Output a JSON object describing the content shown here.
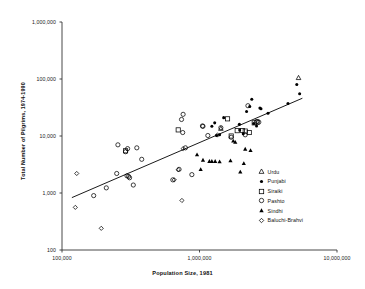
{
  "chart_data": {
    "type": "scatter",
    "title": "",
    "xlabel": "Population Size, 1981",
    "ylabel": "Total Number of Pilgrims, 1974-1990",
    "xscale": "log",
    "yscale": "log",
    "xlim": [
      100000,
      10000000
    ],
    "ylim": [
      100,
      1000000
    ],
    "grid": false,
    "legend_position": "inside-lower-right",
    "xticks": [
      "100,000",
      "1,000,000",
      "10,000,000"
    ],
    "xtick_values": [
      100000,
      1000000,
      10000000
    ],
    "yticks": [
      "100",
      "1,000",
      "10,000",
      "100,000",
      "1,000,000"
    ],
    "ytick_values": [
      100,
      1000,
      10000,
      100000,
      1000000
    ],
    "trendline": {
      "label": "regression line",
      "x_start": 118000,
      "y_start": 830,
      "x_end": 5600000,
      "y_end": 46000
    },
    "series": [
      {
        "name": "Urdu",
        "marker": "open-triangle",
        "points": [
          {
            "x": 5250000,
            "y": 105000
          },
          {
            "x": 1430000,
            "y": 13500
          }
        ]
      },
      {
        "name": "Punjabi",
        "marker": "filled-circle",
        "points": [
          {
            "x": 5100000,
            "y": 80000
          },
          {
            "x": 5350000,
            "y": 55000
          },
          {
            "x": 4400000,
            "y": 37000
          },
          {
            "x": 2400000,
            "y": 44000
          },
          {
            "x": 2320000,
            "y": 33000
          },
          {
            "x": 2200000,
            "y": 27000
          },
          {
            "x": 2750000,
            "y": 31000
          },
          {
            "x": 2800000,
            "y": 30000
          },
          {
            "x": 3150000,
            "y": 25000
          },
          {
            "x": 1500000,
            "y": 21000
          },
          {
            "x": 1290000,
            "y": 17000
          },
          {
            "x": 1230000,
            "y": 14800
          },
          {
            "x": 1950000,
            "y": 16000
          },
          {
            "x": 2480000,
            "y": 16500
          },
          {
            "x": 2600000,
            "y": 15000
          },
          {
            "x": 2080000,
            "y": 11000
          },
          {
            "x": 1960000,
            "y": 12800
          },
          {
            "x": 1400000,
            "y": 10500
          },
          {
            "x": 1330000,
            "y": 10200
          }
        ]
      },
      {
        "name": "Siraiki",
        "marker": "open-square",
        "points": [
          {
            "x": 1600000,
            "y": 20000
          },
          {
            "x": 700000,
            "y": 12800
          },
          {
            "x": 1700000,
            "y": 10000
          },
          {
            "x": 1880000,
            "y": 12400
          },
          {
            "x": 2050000,
            "y": 12500
          },
          {
            "x": 2150000,
            "y": 12200
          },
          {
            "x": 2300000,
            "y": 11500
          },
          {
            "x": 2620000,
            "y": 17500
          },
          {
            "x": 290000,
            "y": 5500
          },
          {
            "x": 2500000,
            "y": 17000
          }
        ]
      },
      {
        "name": "Pashto",
        "marker": "open-circle",
        "points": [
          {
            "x": 760000,
            "y": 24000
          },
          {
            "x": 740000,
            "y": 19500
          },
          {
            "x": 755000,
            "y": 11500
          },
          {
            "x": 1050000,
            "y": 15000
          },
          {
            "x": 1060000,
            "y": 14800
          },
          {
            "x": 1430000,
            "y": 14000
          },
          {
            "x": 2250000,
            "y": 34000
          },
          {
            "x": 2620000,
            "y": 18000
          },
          {
            "x": 2700000,
            "y": 17500
          },
          {
            "x": 2150000,
            "y": 10500
          },
          {
            "x": 1700000,
            "y": 9500
          },
          {
            "x": 790000,
            "y": 6200
          },
          {
            "x": 1150000,
            "y": 10200
          },
          {
            "x": 255000,
            "y": 7000
          },
          {
            "x": 300000,
            "y": 6000
          },
          {
            "x": 350000,
            "y": 6200
          },
          {
            "x": 290000,
            "y": 5300
          },
          {
            "x": 380000,
            "y": 3900
          },
          {
            "x": 250000,
            "y": 2200
          },
          {
            "x": 297000,
            "y": 2000
          },
          {
            "x": 305000,
            "y": 1950
          },
          {
            "x": 310000,
            "y": 1850
          },
          {
            "x": 330000,
            "y": 1380
          },
          {
            "x": 210000,
            "y": 1230
          },
          {
            "x": 170000,
            "y": 900
          },
          {
            "x": 710000,
            "y": 2600
          },
          {
            "x": 880000,
            "y": 2100
          },
          {
            "x": 640000,
            "y": 1700
          }
        ]
      },
      {
        "name": "Sindhi",
        "marker": "filled-triangle",
        "points": [
          {
            "x": 1760000,
            "y": 8200
          },
          {
            "x": 1820000,
            "y": 7800
          },
          {
            "x": 960000,
            "y": 4700
          },
          {
            "x": 1680000,
            "y": 3700
          },
          {
            "x": 1060000,
            "y": 3800
          },
          {
            "x": 1180000,
            "y": 3600
          },
          {
            "x": 1230000,
            "y": 3600
          },
          {
            "x": 1300000,
            "y": 3600
          },
          {
            "x": 1400000,
            "y": 3550
          },
          {
            "x": 1020000,
            "y": 2600
          },
          {
            "x": 2150000,
            "y": 5900
          },
          {
            "x": 2350000,
            "y": 5600
          },
          {
            "x": 2100000,
            "y": 3300
          },
          {
            "x": 1980000,
            "y": 2350
          }
        ]
      },
      {
        "name": "Baluchi-Brahvi",
        "marker": "open-diamond",
        "points": [
          {
            "x": 128000,
            "y": 2200
          },
          {
            "x": 125000,
            "y": 560
          },
          {
            "x": 193000,
            "y": 240
          },
          {
            "x": 745000,
            "y": 740
          },
          {
            "x": 655000,
            "y": 1700
          },
          {
            "x": 700000,
            "y": 2550
          },
          {
            "x": 760000,
            "y": 6000
          },
          {
            "x": 1350000,
            "y": 10400
          }
        ]
      }
    ]
  },
  "legend": {
    "entries": [
      {
        "label": "Urdu",
        "marker": "open-triangle"
      },
      {
        "label": "Punjabi",
        "marker": "filled-circle"
      },
      {
        "label": "Siraiki",
        "marker": "open-square"
      },
      {
        "label": "Pashto",
        "marker": "open-circle"
      },
      {
        "label": "Sindhi",
        "marker": "filled-triangle"
      },
      {
        "label": "Baluchi-Brahvi",
        "marker": "open-diamond"
      }
    ]
  },
  "colors": {
    "axis": "#333333",
    "marker": "#000000",
    "trendline": "#000000",
    "background": "#ffffff"
  }
}
